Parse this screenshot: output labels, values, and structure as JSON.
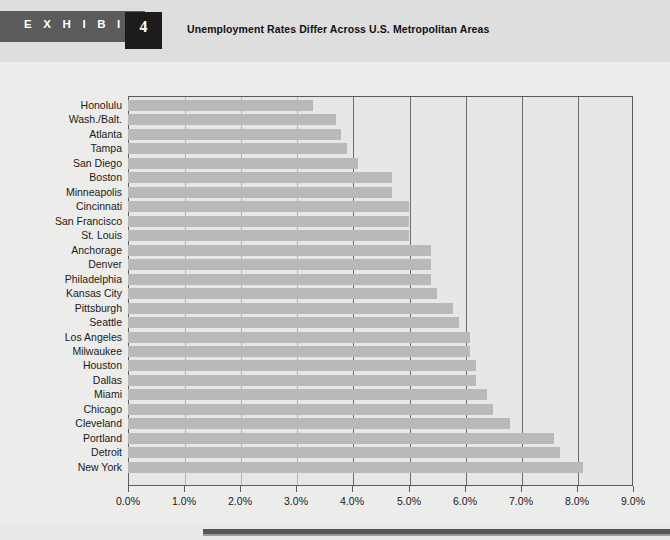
{
  "exhibit": {
    "label": "E X H I B I T",
    "number": "4",
    "title": "Unemployment Rates Differ Across U.S. Metropolitan Areas"
  },
  "colors": {
    "header_band": "#dedede",
    "exhibit_bar": "#5b5b5b",
    "exhibit_number_box": "#1c1c1c",
    "page_background": "#ececeb",
    "plot_background": "#e7e7e5",
    "bar_fill": "#b9b9b7",
    "frame": "#5c5c5c",
    "gridline_major": "#6d6d6d",
    "gridline_minor": "#b4b4b2",
    "footer_rule": "#575757"
  },
  "chart_data": {
    "type": "bar",
    "orientation": "horizontal",
    "title": "Unemployment Rates Differ Across U.S. Metropolitan Areas",
    "xlabel": "",
    "ylabel": "",
    "xlim": [
      0,
      9
    ],
    "grid": true,
    "legend": null,
    "tick_labels": [
      "0.0%",
      "1.0%",
      "2.0%",
      "3.0%",
      "4.0%",
      "5.0%",
      "6.0%",
      "7.0%",
      "8.0%",
      "9.0%"
    ],
    "tick_values": [
      0,
      1,
      2,
      3,
      4,
      5,
      6,
      7,
      8,
      9
    ],
    "categories": [
      "Honolulu",
      "Wash./Balt.",
      "Atlanta",
      "Tampa",
      "San Diego",
      "Boston",
      "Minneapolis",
      "Cincinnati",
      "San Francisco",
      "St. Louis",
      "Anchorage",
      "Denver",
      "Philadelphia",
      "Kansas City",
      "Pittsburgh",
      "Seattle",
      "Los Angeles",
      "Milwaukee",
      "Houston",
      "Dallas",
      "Miami",
      "Chicago",
      "Cleveland",
      "Portland",
      "Detroit",
      "New York"
    ],
    "values": [
      3.3,
      3.7,
      3.8,
      3.9,
      4.1,
      4.7,
      4.7,
      5.0,
      5.0,
      5.0,
      5.4,
      5.4,
      5.4,
      5.5,
      5.8,
      5.9,
      6.1,
      6.1,
      6.2,
      6.2,
      6.4,
      6.5,
      6.8,
      7.6,
      7.7,
      8.1
    ]
  }
}
